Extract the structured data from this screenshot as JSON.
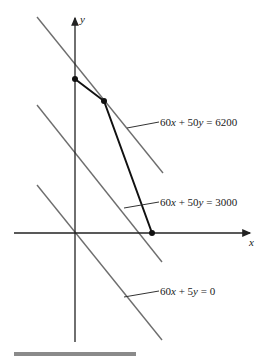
{
  "diagram": {
    "type": "linear-programming-graph",
    "axes": {
      "x_label": "x",
      "y_label": "y"
    },
    "level_lines": [
      {
        "label": "60x + 50y = 6200",
        "parts": [
          "60",
          "x",
          " + 50",
          "y",
          " = 6200"
        ]
      },
      {
        "label": "60x + 50y = 3000",
        "parts": [
          "60",
          "x",
          " + 50",
          "y",
          " = 3000"
        ]
      },
      {
        "label": "60x + 5y = 0",
        "parts": [
          "60",
          "x",
          " + 5",
          "y",
          " = 0"
        ]
      }
    ],
    "feasible_boundary_vertices": [
      {
        "name": "y-intercept vertex"
      },
      {
        "name": "optimal vertex"
      },
      {
        "name": "x-intercept vertex"
      }
    ],
    "colors": {
      "axis": "#222222",
      "level_line": "#6e6e6e",
      "boundary": "#111111",
      "footer_bar": "#8a8a8a"
    }
  }
}
